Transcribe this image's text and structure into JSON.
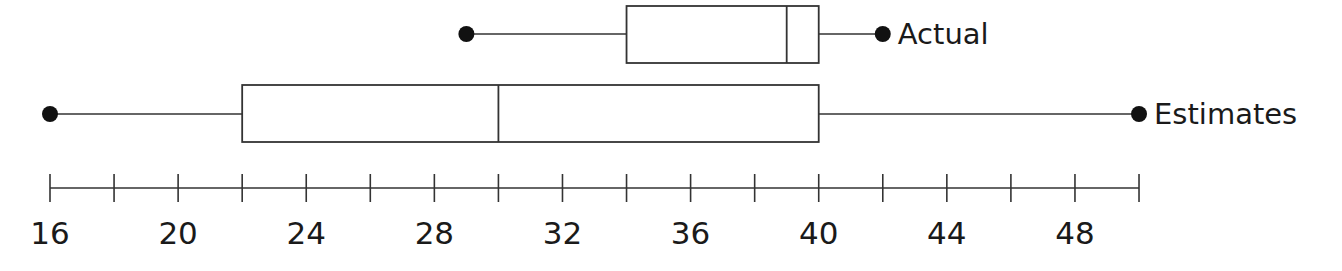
{
  "chart_data": {
    "type": "boxplot",
    "title": "",
    "xlabel": "",
    "ylabel": "",
    "xlim": [
      16,
      50
    ],
    "grid": false,
    "legend": null,
    "axis": {
      "ticks": [
        16,
        18,
        20,
        22,
        24,
        26,
        28,
        30,
        32,
        34,
        36,
        38,
        40,
        42,
        44,
        46,
        48,
        50
      ],
      "tick_labels": [
        {
          "value": 16,
          "label": "16"
        },
        {
          "value": 20,
          "label": "20"
        },
        {
          "value": 24,
          "label": "24"
        },
        {
          "value": 28,
          "label": "28"
        },
        {
          "value": 32,
          "label": "32"
        },
        {
          "value": 36,
          "label": "36"
        },
        {
          "value": 40,
          "label": "40"
        },
        {
          "value": 44,
          "label": "44"
        },
        {
          "value": 48,
          "label": "48"
        }
      ]
    },
    "series": [
      {
        "name": "Actual",
        "min": 29,
        "q1": 34,
        "median": 39,
        "q3": 40,
        "max": 42
      },
      {
        "name": "Estimates",
        "min": 16,
        "q1": 22,
        "median": 30,
        "q3": 40,
        "max": 50
      }
    ]
  },
  "colors": {
    "stroke": "#333333",
    "dot": "#111111",
    "text": "#1a1a1a",
    "background": "#ffffff"
  }
}
